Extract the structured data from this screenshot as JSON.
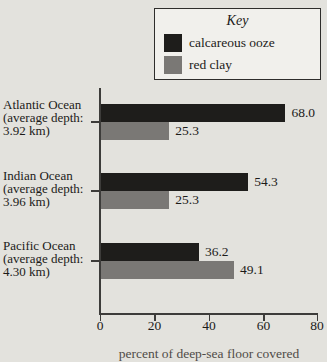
{
  "chart_data": {
    "type": "bar",
    "orientation": "horizontal",
    "xlabel": "percent of deep-sea floor covered",
    "x_ticks": [
      "0",
      "20",
      "40",
      "60",
      "80"
    ],
    "xlim": [
      0,
      80
    ],
    "grid": false,
    "legend": {
      "title": "Key",
      "position": "top-right",
      "entries": [
        {
          "label": "calcareous ooze",
          "color": "#1e1d1b"
        },
        {
          "label": "red clay",
          "color": "#7a7875"
        }
      ]
    },
    "groups": [
      {
        "name": "Atlantic Ocean",
        "label_lines": [
          "Atlantic Ocean",
          "(average depth:",
          "3.92 km)"
        ],
        "series": {
          "calcareous_ooze": 68.0,
          "red_clay": 25.3
        },
        "labels": {
          "calcareous_ooze": "68.0",
          "red_clay": "25.3"
        }
      },
      {
        "name": "Indian Ocean",
        "label_lines": [
          "Indian Ocean",
          "(average depth:",
          "3.96 km)"
        ],
        "series": {
          "calcareous_ooze": 54.3,
          "red_clay": 25.3
        },
        "labels": {
          "calcareous_ooze": "54.3",
          "red_clay": "25.3"
        }
      },
      {
        "name": "Pacific Ocean",
        "label_lines": [
          "Pacific Ocean",
          "(average depth:",
          "4.30 km)"
        ],
        "series": {
          "calcareous_ooze": 36.2,
          "red_clay": 49.1
        },
        "labels": {
          "calcareous_ooze": "36.2",
          "red_clay": "49.1"
        }
      }
    ]
  },
  "colors": {
    "background": "#e3e2dd",
    "legend_background": "#f1f0ec",
    "calcareous_ooze": "#1e1d1b",
    "red_clay": "#7a7875",
    "axis": "#3d3c3a",
    "text": "#1c1b19"
  }
}
